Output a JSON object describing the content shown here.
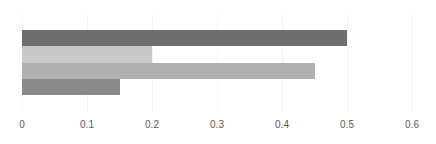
{
  "chart_data": {
    "type": "bar",
    "orientation": "horizontal",
    "title": "",
    "subtitle": "",
    "xlabel": "",
    "ylabel": "",
    "categories": [
      "",
      "",
      "",
      ""
    ],
    "values": [
      0.5,
      0.2,
      0.45,
      0.15
    ],
    "bar_colors": [
      "#6e6e6e",
      "#c8c8c8",
      "#b0b0b0",
      "#8a8a8a"
    ],
    "xlim": [
      0,
      0.63
    ],
    "xticks": [
      0,
      0.1,
      0.2,
      0.3,
      0.4,
      0.5,
      0.6
    ],
    "xtick_labels": [
      "0",
      "0.1",
      "0.2",
      "0.3",
      "0.4",
      "0.5",
      "0.6"
    ],
    "grid": true,
    "grid_axis": "x",
    "gridline_color": "#f2f2f2",
    "legend": false,
    "legend_position": "none",
    "annotations": [],
    "data_labels": false,
    "background_color": "#ffffff",
    "tick_label_color": "#595959",
    "bars": [
      {
        "label": "",
        "value": 0.5,
        "color": "#6e6e6e"
      },
      {
        "label": "",
        "value": 0.2,
        "color": "#c8c8c8"
      },
      {
        "label": "",
        "value": 0.45,
        "color": "#b0b0b0"
      },
      {
        "label": "",
        "value": 0.15,
        "color": "#8a8a8a"
      }
    ]
  }
}
